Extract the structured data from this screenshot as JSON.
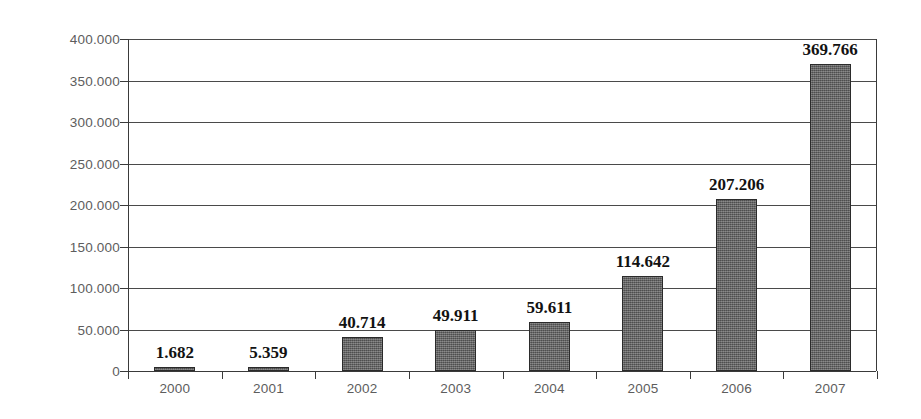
{
  "chart_data": {
    "type": "bar",
    "title": "",
    "subtitle": "",
    "xlabel": "",
    "ylabel": "",
    "categories": [
      "2000",
      "2001",
      "2002",
      "2003",
      "2004",
      "2005",
      "2006",
      "2007"
    ],
    "values": [
      1682,
      5359,
      40714,
      49911,
      59611,
      114642,
      207206,
      369766
    ],
    "data_labels": [
      "1.682",
      "5.359",
      "40.714",
      "49.911",
      "59.611",
      "114.642",
      "207.206",
      "369.766"
    ],
    "ylim": [
      0,
      400000
    ],
    "ytick_values": [
      0,
      50000,
      100000,
      150000,
      200000,
      250000,
      300000,
      350000,
      400000
    ],
    "ytick_labels": [
      "0",
      "50.000",
      "100.000",
      "150.000",
      "200.000",
      "250.000",
      "300.000",
      "350.000",
      "400.000"
    ],
    "grid": true,
    "grid_axis": "y",
    "legend": false,
    "legend_position": "none",
    "series": [
      {
        "name": "",
        "values": [
          1682,
          5359,
          40714,
          49911,
          59611,
          114642,
          207206,
          369766
        ],
        "color": "#636363"
      }
    ],
    "number_format": "thousands separator: period (.)",
    "colors": {
      "bar_fill": "#636363",
      "bar_border": "#2b2b2b",
      "axis": "#3a3a3a",
      "gridline": "#4a4a4a",
      "tick_label": "#5d5d5d",
      "value_label": "#121212",
      "background": "#ffffff"
    }
  }
}
